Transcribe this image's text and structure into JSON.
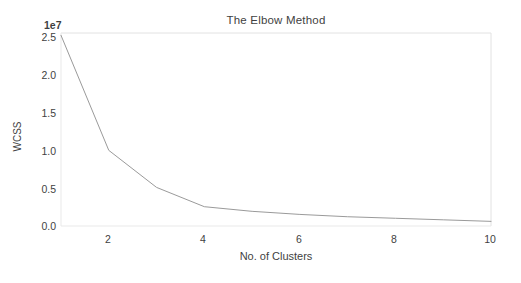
{
  "chart_data": {
    "type": "line",
    "title": "The Elbow Method",
    "xlabel": "No. of Clusters",
    "ylabel": "WCSS",
    "y_offset_text": "1e7",
    "x": [
      1,
      2,
      3,
      4,
      5,
      6,
      7,
      8,
      9,
      10
    ],
    "values": [
      24700000,
      9800000,
      5000000,
      2500000,
      1900000,
      1500000,
      1200000,
      1000000,
      800000,
      600000
    ],
    "series": [
      {
        "name": "WCSS",
        "values": [
          24700000,
          9800000,
          5000000,
          2500000,
          1900000,
          1500000,
          1200000,
          1000000,
          800000,
          600000
        ]
      }
    ],
    "xlim": [
      1,
      10
    ],
    "ylim": [
      0,
      25000000
    ],
    "xticks": [
      "2",
      "4",
      "6",
      "8",
      "10"
    ],
    "xtick_values": [
      2,
      4,
      6,
      8,
      10
    ],
    "yticks": [
      "0.0",
      "0.5",
      "1.0",
      "1.5",
      "2.0",
      "2.5"
    ],
    "ytick_values": [
      0,
      5000000,
      10000000,
      15000000,
      20000000,
      25000000
    ],
    "grid": false,
    "legend": "none",
    "line_color": "#9a9a9a",
    "background_color": "#ffffff",
    "axis_color": "#d8d8d8",
    "text_color": "#3f3f3f"
  }
}
